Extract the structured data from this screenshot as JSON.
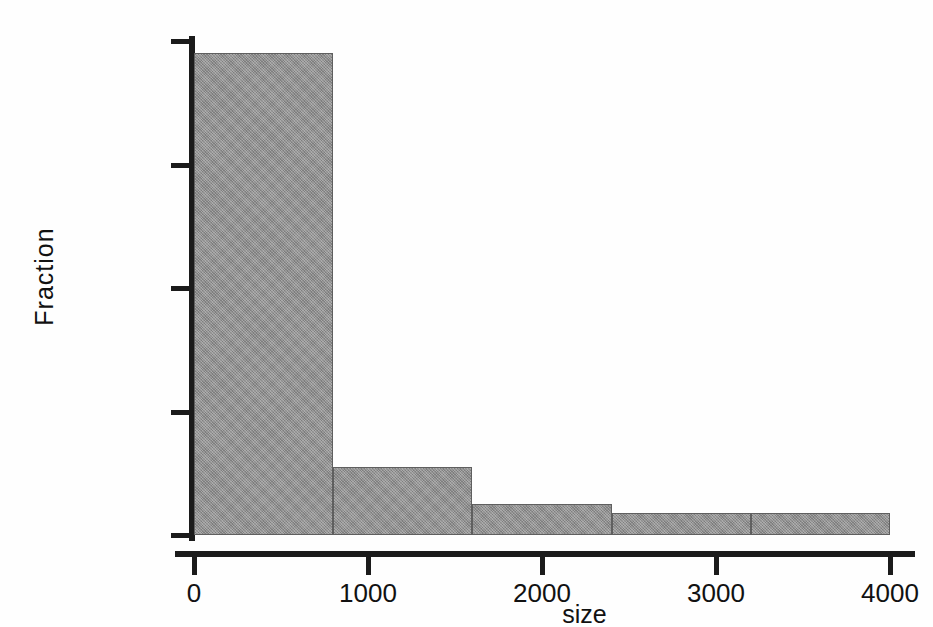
{
  "chart_data": {
    "type": "bar",
    "title": "",
    "subtitle": "",
    "xlabel": "size",
    "ylabel": "Fraction",
    "grid": false,
    "legend": "none",
    "xlim": [
      0,
      4000
    ],
    "ylim": [
      0,
      0.8
    ],
    "bin_width": 800,
    "categories": [
      "0-800",
      "800-1600",
      "1600-2400",
      "2400-3200",
      "3200-4000"
    ],
    "bin_edges": [
      0,
      800,
      1600,
      2400,
      3200,
      4000
    ],
    "values": [
      0.78,
      0.11,
      0.05,
      0.035,
      0.035
    ],
    "xticks": [
      0,
      1000,
      2000,
      3000,
      4000
    ],
    "xtick_labels": [
      "0",
      "1000",
      "2000",
      "3000",
      "4000"
    ],
    "yticks": [
      0,
      0.2,
      0.4,
      0.6,
      0.8
    ],
    "ytick_labels": [
      "0",
      ".2",
      ".4",
      ".6",
      ".8"
    ],
    "bar_color": "#909090",
    "bar_edge_color": "#5f5f5f",
    "axis_color": "#1b1b1b",
    "background_color": "#ffffff"
  }
}
